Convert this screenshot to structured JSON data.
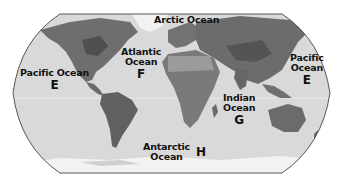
{
  "map": {
    "projection": "world-oval",
    "colors": {
      "ocean": "#d9d9d9",
      "land_dark": "#5a5a5a",
      "land_mid": "#7d7d7d",
      "land_light": "#a3a3a3",
      "ice": "#f2f2f2",
      "outline": "#555555",
      "background": "#ffffff"
    },
    "labels": [
      {
        "id": "arctic",
        "name": "Arctic Ocean",
        "letter": ""
      },
      {
        "id": "atlantic",
        "name_line1": "Atlantic",
        "name_line2": "Ocean",
        "letter": "F"
      },
      {
        "id": "pacific-west",
        "name": "Pacific Ocean",
        "letter": "E"
      },
      {
        "id": "pacific-east",
        "name_line1": "Pacific",
        "name_line2": "Ocean",
        "letter": "E"
      },
      {
        "id": "indian",
        "name_line1": "Indian",
        "name_line2": "Ocean",
        "letter": "G"
      },
      {
        "id": "antarctic",
        "name_line1": "Antarctic",
        "name_line2": "Ocean",
        "letter": "H"
      }
    ]
  }
}
